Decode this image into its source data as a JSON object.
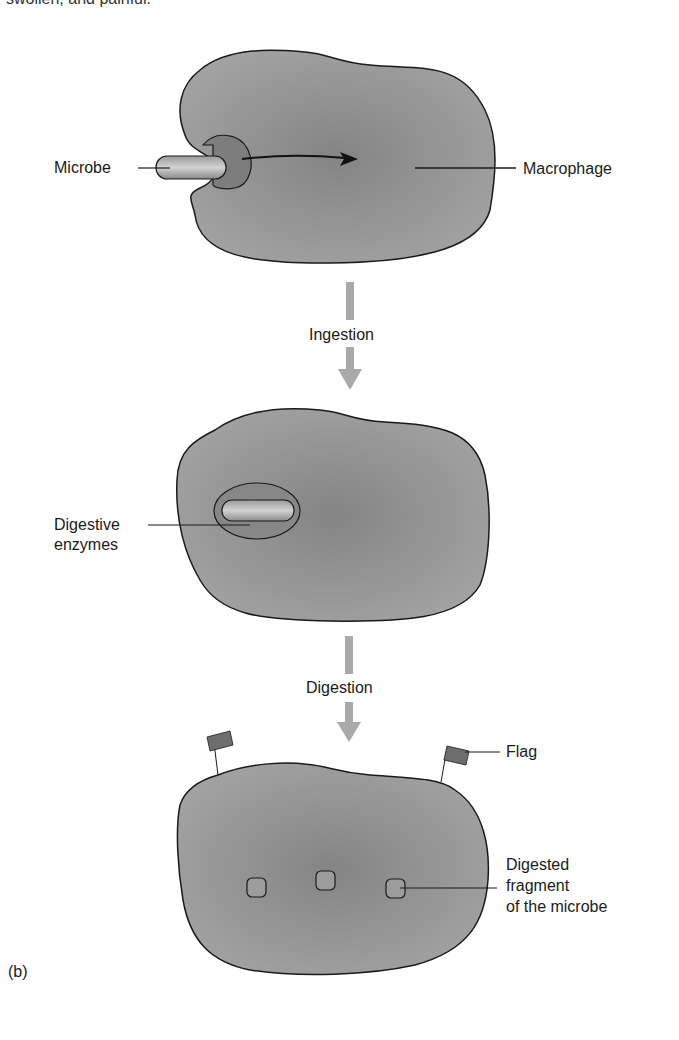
{
  "top_text": "swollen, and painful.",
  "panel_label": "(b)",
  "labels": {
    "microbe": "Microbe",
    "macrophage": "Macrophage",
    "ingestion": "Ingestion",
    "digestive_enzymes_1": "Digestive",
    "digestive_enzymes_2": "enzymes",
    "digestion": "Digestion",
    "flag": "Flag",
    "fragment_1": "Digested",
    "fragment_2": "fragment",
    "fragment_3": "of the microbe"
  },
  "colors": {
    "cell_fill": "#8f8f8f",
    "cell_edge": "#1a1a1a",
    "arrow_gray": "#a9a9a9",
    "flag_fill": "#6e6e6e"
  }
}
